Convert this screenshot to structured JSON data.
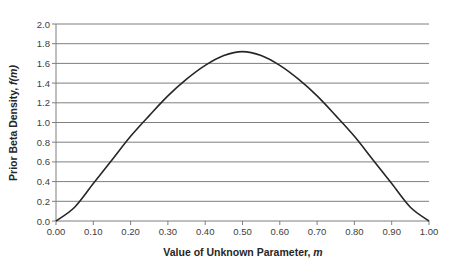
{
  "chart_data": {
    "type": "line",
    "title": "",
    "xlabel": "Value of Unknown Parameter, m",
    "xlabel_main": "Value of Unknown Parameter, ",
    "xlabel_var": "m",
    "ylabel": "Prior Beta Density, f(m)",
    "ylabel_main": "Prior Beta Density, ",
    "ylabel_var": "f(m)",
    "xlim": [
      0,
      1
    ],
    "ylim": [
      0,
      2
    ],
    "grid": {
      "horizontal": true,
      "vertical": false
    },
    "legend": null,
    "x_ticks": [
      "0.00",
      "0.10",
      "0.20",
      "0.30",
      "0.40",
      "0.50",
      "0.60",
      "0.70",
      "0.80",
      "0.90",
      "1.00"
    ],
    "y_ticks": [
      "0.0",
      "0.2",
      "0.4",
      "0.6",
      "0.8",
      "1.0",
      "1.2",
      "1.4",
      "1.6",
      "1.8",
      "2.0"
    ],
    "series": [
      {
        "name": "Prior Beta Density",
        "color": "#262626",
        "x": [
          0.0,
          0.05,
          0.1,
          0.15,
          0.2,
          0.25,
          0.3,
          0.35,
          0.4,
          0.45,
          0.5,
          0.55,
          0.6,
          0.65,
          0.7,
          0.75,
          0.8,
          0.85,
          0.9,
          0.95,
          1.0
        ],
        "y": [
          0.0,
          0.14,
          0.38,
          0.62,
          0.86,
          1.07,
          1.27,
          1.44,
          1.58,
          1.68,
          1.72,
          1.68,
          1.58,
          1.44,
          1.27,
          1.07,
          0.86,
          0.62,
          0.38,
          0.14,
          0.0
        ]
      }
    ]
  },
  "colors": {
    "line": "#262626",
    "grid": "#7f7f7f",
    "axis": "#7f7f7f"
  }
}
